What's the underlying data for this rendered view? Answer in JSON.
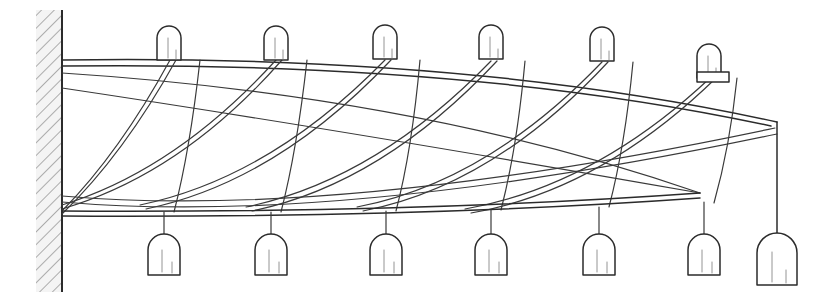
{
  "figure": {
    "title": "Wall-mounted suspended rail assembly",
    "caption": "",
    "background_color": "#ffffff",
    "line_color": "#2b2b2b",
    "hatch_color": "#6f6f6f",
    "wall_fill": "#f4f4f4",
    "canvas": {
      "width": 815,
      "height": 302
    }
  },
  "wall": {
    "label": "hatched-wall",
    "x": 36,
    "y": 10,
    "width": 26,
    "height": 282,
    "edge_x": 62,
    "hatch_angle_deg": 45,
    "hatch_spacing": 9
  },
  "rails": {
    "top_rail": {
      "label": "top-rail",
      "start": [
        62,
        60
      ],
      "end": [
        777,
        122
      ],
      "control": [
        600,
        58
      ]
    },
    "top_rail_inner": {
      "label": "top-rail-inner",
      "start": [
        62,
        66
      ],
      "end": [
        775,
        128
      ],
      "control": [
        600,
        66
      ]
    },
    "bottom_rail": {
      "label": "bottom-rail",
      "start": [
        62,
        211
      ],
      "end": [
        700,
        193
      ],
      "control": [
        420,
        214
      ]
    },
    "bottom_rail_inner": {
      "label": "bottom-rail-inner",
      "start": [
        62,
        216
      ],
      "end": [
        700,
        199
      ],
      "control": [
        420,
        219
      ]
    },
    "drop_line": {
      "label": "right-vertical-drop",
      "start": [
        777,
        122
      ],
      "end": [
        777,
        233
      ]
    }
  },
  "top_posts": [
    {
      "id": "top-post-1",
      "x": 168,
      "y": 60,
      "width": 24,
      "height": 34,
      "has_flange": false
    },
    {
      "id": "top-post-2",
      "x": 274,
      "y": 60,
      "width": 24,
      "height": 34,
      "has_flange": false
    },
    {
      "id": "top-post-3",
      "x": 383,
      "y": 60,
      "width": 24,
      "height": 34,
      "has_flange": false
    },
    {
      "id": "top-post-4",
      "x": 489,
      "y": 60,
      "width": 24,
      "height": 34,
      "has_flange": false
    },
    {
      "id": "top-post-5",
      "x": 600,
      "y": 62,
      "width": 24,
      "height": 34,
      "has_flange": false
    },
    {
      "id": "top-post-6",
      "x": 707,
      "y": 78,
      "width": 24,
      "height": 34,
      "has_flange": true
    }
  ],
  "bottom_posts": [
    {
      "id": "bottom-post-1",
      "x": 160,
      "y": 235,
      "width": 28,
      "height": 40,
      "stem_top": 212
    },
    {
      "id": "bottom-post-2",
      "x": 267,
      "y": 235,
      "width": 28,
      "height": 40,
      "stem_top": 212
    },
    {
      "id": "bottom-post-3",
      "x": 382,
      "y": 235,
      "width": 28,
      "height": 40,
      "stem_top": 211
    },
    {
      "id": "bottom-post-4",
      "x": 487,
      "y": 235,
      "width": 28,
      "height": 40,
      "stem_top": 210
    },
    {
      "id": "bottom-post-5",
      "x": 595,
      "y": 235,
      "width": 28,
      "height": 40,
      "stem_top": 207
    },
    {
      "id": "bottom-post-6",
      "x": 700,
      "y": 235,
      "width": 28,
      "height": 40,
      "stem_top": 203
    },
    {
      "id": "bottom-post-7",
      "x": 777,
      "y": 233,
      "width": 40,
      "height": 52,
      "stem_top": 122
    }
  ],
  "cables": {
    "descending_pairs": [
      {
        "id": "cable-pair-1",
        "from": [
          168,
          60
        ],
        "to": [
          62,
          213
        ],
        "control": [
          104,
          160
        ]
      },
      {
        "id": "cable-pair-2",
        "from": [
          274,
          60
        ],
        "to": [
          62,
          208
        ],
        "control": [
          150,
          186
        ]
      },
      {
        "id": "cable-pair-3",
        "from": [
          383,
          61
        ],
        "to": [
          110,
          205
        ],
        "control": [
          212,
          196
        ]
      },
      {
        "id": "cable-pair-4",
        "from": [
          489,
          62
        ],
        "to": [
          210,
          204
        ],
        "control": [
          314,
          196
        ]
      },
      {
        "id": "cable-pair-5",
        "from": [
          600,
          64
        ],
        "to": [
          320,
          202
        ],
        "control": [
          424,
          194
        ]
      },
      {
        "id": "cable-pair-6",
        "from": [
          710,
          80
        ],
        "to": [
          430,
          200
        ],
        "control": [
          534,
          192
        ]
      }
    ],
    "ascending_arcs": [
      {
        "id": "arc-1",
        "from": [
          62,
          73
        ],
        "to": [
          700,
          193
        ],
        "control": [
          420,
          100
        ]
      },
      {
        "id": "arc-2",
        "from": [
          62,
          88
        ],
        "to": [
          700,
          193
        ],
        "control": [
          330,
          130
        ]
      },
      {
        "id": "arc-3",
        "from": [
          62,
          196
        ],
        "to": [
          775,
          128
        ],
        "control": [
          330,
          218
        ]
      }
    ],
    "hangers": [
      {
        "id": "hanger-1",
        "from": [
          160,
          212
        ],
        "to": [
          196,
          60
        ]
      },
      {
        "id": "hanger-2",
        "from": [
          267,
          212
        ],
        "to": [
          303,
          60
        ]
      },
      {
        "id": "hanger-3",
        "from": [
          382,
          211
        ],
        "to": [
          413,
          61
        ]
      },
      {
        "id": "hanger-4",
        "from": [
          487,
          210
        ],
        "to": [
          518,
          62
        ]
      },
      {
        "id": "hanger-5",
        "from": [
          595,
          207
        ],
        "to": [
          629,
          63
        ]
      },
      {
        "id": "hanger-6",
        "from": [
          700,
          203
        ],
        "to": [
          735,
          80
        ]
      }
    ]
  },
  "counts": {
    "top_posts": 6,
    "bottom_posts": 7,
    "cable_pairs": 6,
    "ascending_arcs": 3
  }
}
